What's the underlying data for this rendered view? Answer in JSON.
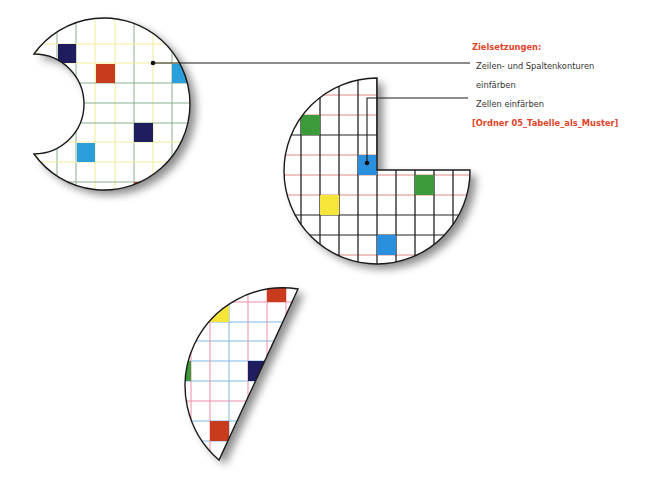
{
  "annotation": {
    "heading": "Zielsetzungen:",
    "goals": [
      {
        "line1": "Zeilen- und Spaltenkonturen",
        "line2": "einfärben"
      },
      {
        "line1": "Zellen einfärben"
      }
    ],
    "folder": "[Ordner 05_Tabelle_als_Muster]"
  },
  "colors": {
    "accent_text": "#e0442a",
    "navy": "#1f1d5e",
    "orange": "#c93b1d",
    "light_blue": "#2a9fdc",
    "green": "#3d9a3a",
    "yellow": "#f6e63a",
    "grid_green": "#8bb08a",
    "grid_yellow": "#f1ec9b",
    "grid_red": "#d98b86",
    "grid_black": "#222222",
    "grid_blue": "#7fb7e6",
    "grid_pink": "#ec8fa6"
  },
  "shapes": [
    {
      "name": "shape-1-crescent",
      "grid_style": "green/yellow outlines",
      "colored_cells": [
        {
          "color": "navy",
          "x": 58,
          "y": 44
        },
        {
          "color": "orange",
          "x": 96,
          "y": 64
        },
        {
          "color": "light_blue",
          "x": 172,
          "y": 64
        },
        {
          "color": "navy",
          "x": 134,
          "y": 123
        },
        {
          "color": "light_blue",
          "x": 77,
          "y": 143
        },
        {
          "color": "orange",
          "x": 191,
          "y": 143
        },
        {
          "color": "orange",
          "x": 134,
          "y": 182
        }
      ]
    },
    {
      "name": "shape-2-pacman",
      "grid_style": "black columns, red rows",
      "colored_cells": [
        {
          "color": "green",
          "x": 301,
          "y": 115
        },
        {
          "color": "light_blue",
          "x": 358,
          "y": 155
        },
        {
          "color": "green",
          "x": 415,
          "y": 175
        },
        {
          "color": "yellow",
          "x": 320,
          "y": 195
        },
        {
          "color": "light_blue",
          "x": 377,
          "y": 235
        }
      ]
    },
    {
      "name": "shape-3-half-disc",
      "grid_style": "pink columns, blue rows",
      "colored_cells": [
        {
          "color": "orange",
          "x": 267,
          "y": 284
        },
        {
          "color": "yellow",
          "x": 210,
          "y": 302
        },
        {
          "color": "green",
          "x": 172,
          "y": 361
        },
        {
          "color": "navy",
          "x": 248,
          "y": 361
        },
        {
          "color": "orange",
          "x": 210,
          "y": 421
        }
      ]
    }
  ]
}
